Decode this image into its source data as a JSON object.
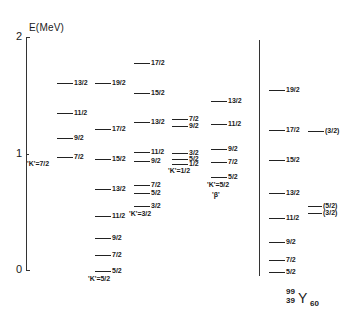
{
  "axis": {
    "title": "E(MeV)",
    "ticks": [
      {
        "label": "2",
        "value": 2
      },
      {
        "label": "1",
        "value": 1
      },
      {
        "label": "0",
        "value": 0
      }
    ]
  },
  "nuclide": {
    "mass_number": "99",
    "atomic_number": "39",
    "symbol": "Y",
    "neutron_number": "60"
  },
  "chart_data": {
    "type": "level-scheme",
    "title": "",
    "ylabel": "E(MeV)",
    "ylim": [
      0,
      2
    ],
    "yticks": [
      0,
      1,
      2
    ],
    "nuclide": "99/39 Y 60",
    "bands": [
      {
        "name": "K=7/2",
        "label": "'K'=7/2",
        "levels": [
          {
            "spin": "7/2",
            "energy": 0.97
          },
          {
            "spin": "9/2",
            "energy": 1.13
          },
          {
            "spin": "11/2",
            "energy": 1.35
          },
          {
            "spin": "13/2",
            "energy": 1.61
          }
        ]
      },
      {
        "name": "K=5/2 (ground)",
        "label": "'K'=5/2",
        "levels": [
          {
            "spin": "5/2",
            "energy": 0.0
          },
          {
            "spin": "7/2",
            "energy": 0.13
          },
          {
            "spin": "9/2",
            "energy": 0.28
          },
          {
            "spin": "11/2",
            "energy": 0.46
          },
          {
            "spin": "13/2",
            "energy": 0.69
          },
          {
            "spin": "15/2",
            "energy": 0.95
          },
          {
            "spin": "17/2",
            "energy": 1.21
          },
          {
            "spin": "19/2",
            "energy": 1.61
          }
        ]
      },
      {
        "name": "K=3/2",
        "label": "'K'=3/2",
        "levels": [
          {
            "spin": "3/2",
            "energy": 0.55
          },
          {
            "spin": "5/2",
            "energy": 0.66
          },
          {
            "spin": "7/2",
            "energy": 0.73
          },
          {
            "spin": "9/2",
            "energy": 0.94
          },
          {
            "spin": "11/2",
            "energy": 1.01
          },
          {
            "spin": "13/2",
            "energy": 1.27
          },
          {
            "spin": "15/2",
            "energy": 1.52
          },
          {
            "spin": "17/2",
            "energy": 1.78
          }
        ]
      },
      {
        "name": "K=1/2",
        "label": "'K'=1/2",
        "levels": [
          {
            "spin": "1/2",
            "energy": 0.91
          },
          {
            "spin": "5/2",
            "energy": 0.95
          },
          {
            "spin": "3/2",
            "energy": 1.0
          },
          {
            "spin": "9/2",
            "energy": 1.24
          },
          {
            "spin": "7/2",
            "energy": 1.3
          }
        ]
      },
      {
        "name": "K=5/2 beta",
        "label": "'K'=5/2",
        "sublabel": "'β'",
        "levels": [
          {
            "spin": "5/2",
            "energy": 0.8
          },
          {
            "spin": "7/2",
            "energy": 0.93
          },
          {
            "spin": "9/2",
            "energy": 1.04
          },
          {
            "spin": "11/2",
            "energy": 1.25
          },
          {
            "spin": "13/2",
            "energy": 1.45
          }
        ]
      },
      {
        "name": "Experiment",
        "label": "",
        "levels": [
          {
            "spin": "5/2",
            "energy": 0.0
          },
          {
            "spin": "7/2",
            "energy": 0.09
          },
          {
            "spin": "9/2",
            "energy": 0.24
          },
          {
            "spin": "11/2",
            "energy": 0.45
          },
          {
            "spin": "13/2",
            "energy": 0.66
          },
          {
            "spin": "15/2",
            "energy": 0.94
          },
          {
            "spin": "17/2",
            "energy": 1.2
          },
          {
            "spin": "19/2",
            "energy": 1.55
          }
        ]
      },
      {
        "name": "Experiment side levels",
        "label": "",
        "levels": [
          {
            "spin": "(3/2)",
            "energy": 1.19
          },
          {
            "spin": "(3/2)",
            "energy": 0.49
          },
          {
            "spin": "(5/2)",
            "energy": 0.55
          }
        ]
      }
    ]
  },
  "layout_levels": [
    {
      "band": 0,
      "x": 57,
      "y": 157,
      "w": 16,
      "label": "7/2"
    },
    {
      "band": 0,
      "x": 57,
      "y": 138,
      "w": 16,
      "label": "9/2"
    },
    {
      "band": 0,
      "x": 57,
      "y": 113,
      "w": 16,
      "label": "11/2"
    },
    {
      "band": 0,
      "x": 57,
      "y": 83,
      "w": 16,
      "label": "13/2"
    },
    {
      "band": 1,
      "x": 95,
      "y": 271,
      "w": 16,
      "label": "5/2"
    },
    {
      "band": 1,
      "x": 95,
      "y": 255,
      "w": 16,
      "label": "7/2"
    },
    {
      "band": 1,
      "x": 95,
      "y": 238,
      "w": 16,
      "label": "9/2"
    },
    {
      "band": 1,
      "x": 95,
      "y": 216,
      "w": 16,
      "label": "11/2"
    },
    {
      "band": 1,
      "x": 95,
      "y": 189,
      "w": 16,
      "label": "13/2"
    },
    {
      "band": 1,
      "x": 95,
      "y": 159,
      "w": 16,
      "label": "15/2"
    },
    {
      "band": 1,
      "x": 95,
      "y": 129,
      "w": 16,
      "label": "17/2"
    },
    {
      "band": 1,
      "x": 95,
      "y": 83,
      "w": 16,
      "label": "19/2"
    },
    {
      "band": 2,
      "x": 134,
      "y": 206,
      "w": 16,
      "label": "3/2"
    },
    {
      "band": 2,
      "x": 134,
      "y": 193,
      "w": 16,
      "label": "5/2"
    },
    {
      "band": 2,
      "x": 134,
      "y": 185,
      "w": 16,
      "label": "7/2"
    },
    {
      "band": 2,
      "x": 134,
      "y": 161,
      "w": 16,
      "label": "9/2"
    },
    {
      "band": 2,
      "x": 134,
      "y": 152,
      "w": 16,
      "label": "11/2"
    },
    {
      "band": 2,
      "x": 134,
      "y": 122,
      "w": 16,
      "label": "13/2"
    },
    {
      "band": 2,
      "x": 134,
      "y": 93,
      "w": 16,
      "label": "15/2"
    },
    {
      "band": 2,
      "x": 134,
      "y": 63,
      "w": 16,
      "label": "17/2"
    },
    {
      "band": 3,
      "x": 172,
      "y": 164,
      "w": 16,
      "label": "1/2"
    },
    {
      "band": 3,
      "x": 172,
      "y": 159,
      "w": 16,
      "label": "5/2"
    },
    {
      "band": 3,
      "x": 172,
      "y": 153,
      "w": 16,
      "label": "3/2"
    },
    {
      "band": 3,
      "x": 172,
      "y": 126,
      "w": 16,
      "label": "9/2"
    },
    {
      "band": 3,
      "x": 172,
      "y": 119,
      "w": 16,
      "label": "7/2"
    },
    {
      "band": 4,
      "x": 211,
      "y": 177,
      "w": 16,
      "label": "5/2"
    },
    {
      "band": 4,
      "x": 211,
      "y": 162,
      "w": 16,
      "label": "7/2"
    },
    {
      "band": 4,
      "x": 211,
      "y": 149,
      "w": 16,
      "label": "9/2"
    },
    {
      "band": 4,
      "x": 211,
      "y": 124,
      "w": 16,
      "label": "11/2"
    },
    {
      "band": 4,
      "x": 211,
      "y": 101,
      "w": 16,
      "label": "13/2"
    },
    {
      "band": 5,
      "x": 269,
      "y": 272,
      "w": 16,
      "label": "5/2"
    },
    {
      "band": 5,
      "x": 269,
      "y": 260,
      "w": 16,
      "label": "7/2"
    },
    {
      "band": 5,
      "x": 269,
      "y": 242,
      "w": 16,
      "label": "9/2"
    },
    {
      "band": 5,
      "x": 269,
      "y": 218,
      "w": 16,
      "label": "11/2"
    },
    {
      "band": 5,
      "x": 269,
      "y": 193,
      "w": 16,
      "label": "13/2"
    },
    {
      "band": 5,
      "x": 269,
      "y": 160,
      "w": 16,
      "label": "15/2"
    },
    {
      "band": 5,
      "x": 269,
      "y": 130,
      "w": 16,
      "label": "17/2"
    },
    {
      "band": 5,
      "x": 269,
      "y": 90,
      "w": 16,
      "label": "19/2"
    },
    {
      "band": 6,
      "x": 308,
      "y": 131,
      "w": 16,
      "label": "(3/2)"
    },
    {
      "band": 6,
      "x": 308,
      "y": 206,
      "w": 14,
      "label": "(5/2)"
    },
    {
      "band": 6,
      "x": 308,
      "y": 213,
      "w": 14,
      "label": "(3/2)"
    }
  ],
  "layout_band_labels": [
    {
      "x": 27,
      "y": 160,
      "text": "'K'=7/2"
    },
    {
      "x": 88,
      "y": 275,
      "text": "'K'=5/2"
    },
    {
      "x": 129,
      "y": 210,
      "text": "'K'=3/2"
    },
    {
      "x": 168,
      "y": 167,
      "text": "'K'=1/2"
    },
    {
      "x": 207,
      "y": 181,
      "text": "'K'=5/2"
    },
    {
      "x": 212,
      "y": 191,
      "text": "'β'"
    }
  ]
}
